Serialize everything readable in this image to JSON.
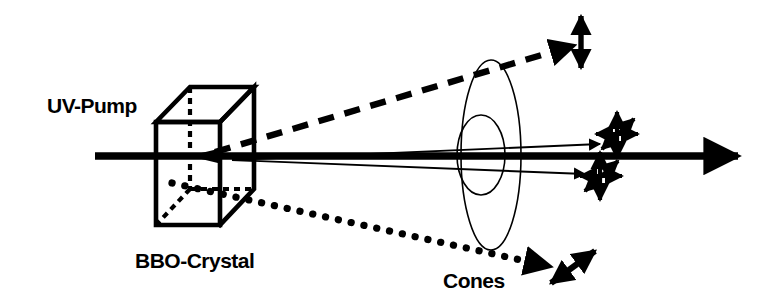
{
  "figure": {
    "background_color": "#ffffff",
    "ink_color": "#000000",
    "width": 763,
    "height": 305
  },
  "labels": {
    "pump": "UV-Pump",
    "crystal": "BBO-Crystal",
    "cones": "Cones"
  },
  "elements": {
    "crystal_name": "bbo-crystal-cube",
    "pump_beam_name": "uv-pump-beam-axis",
    "cone_outer_name": "outer-emission-cone-ellipse",
    "cone_inner_name": "inner-emission-cone-ellipse",
    "dashed_ray_name": "vertical-polarized-signal-ray",
    "dotted_ray_name": "diagonal-polarized-idler-ray",
    "thin_ray_upper_name": "upper-correlated-photon-ray",
    "thin_ray_lower_name": "lower-correlated-photon-ray"
  },
  "polarization_markers": {
    "top_right": {
      "name": "vertical-polarization-arrow",
      "orientation": "vertical",
      "style": "double-headed"
    },
    "bottom_right": {
      "name": "diagonal-polarization-arrow",
      "orientation": "diagonal-45",
      "style": "double-headed"
    },
    "center_upper": {
      "name": "superposition-polarization-star-upper",
      "orientation": "multi-axis",
      "style": "double-headed-cross"
    },
    "center_lower": {
      "name": "superposition-polarization-star-lower",
      "orientation": "multi-axis",
      "style": "double-headed-cross"
    }
  }
}
